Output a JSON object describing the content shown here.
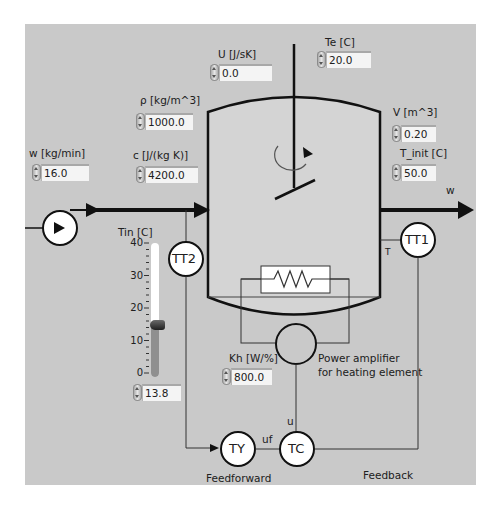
{
  "panel": {
    "background": "#c9c9c9",
    "tank_interior": "#d4d4d4"
  },
  "controls": {
    "U": {
      "label": "U [J/sK]",
      "value": "0.0"
    },
    "Te": {
      "label": "Te [C]",
      "value": "20.0"
    },
    "rho": {
      "label": "ρ [kg/m^3]",
      "value": "1000.0"
    },
    "c": {
      "label": "c [J/(kg K)]",
      "value": "4200.0"
    },
    "w": {
      "label": "w [kg/min]",
      "value": "16.0"
    },
    "V": {
      "label": "V [m^3]",
      "value": "0.20"
    },
    "T_init": {
      "label": "T_init [C]",
      "value": "50.0"
    },
    "Kh": {
      "label": "Kh [W/%]",
      "value": "800.0"
    },
    "Tin": {
      "label": "Tin [C]",
      "value": "13.8"
    }
  },
  "slider": {
    "min": 0,
    "max": 40,
    "value": 13.8,
    "ticks": [
      "40",
      "30",
      "20",
      "10",
      "0"
    ]
  },
  "diagram": {
    "outlet_label": "w",
    "temperature_label": "T",
    "tt1_label": "TT1",
    "tt2_label": "TT2",
    "ty_label": "TY",
    "tc_label": "TC",
    "u_label": "u",
    "uf_label": "uf",
    "power_amp_line1": "Power amplifier",
    "power_amp_line2": "for heating element",
    "feedforward_label": "Feedforward",
    "feedback_label": "Feedback"
  }
}
